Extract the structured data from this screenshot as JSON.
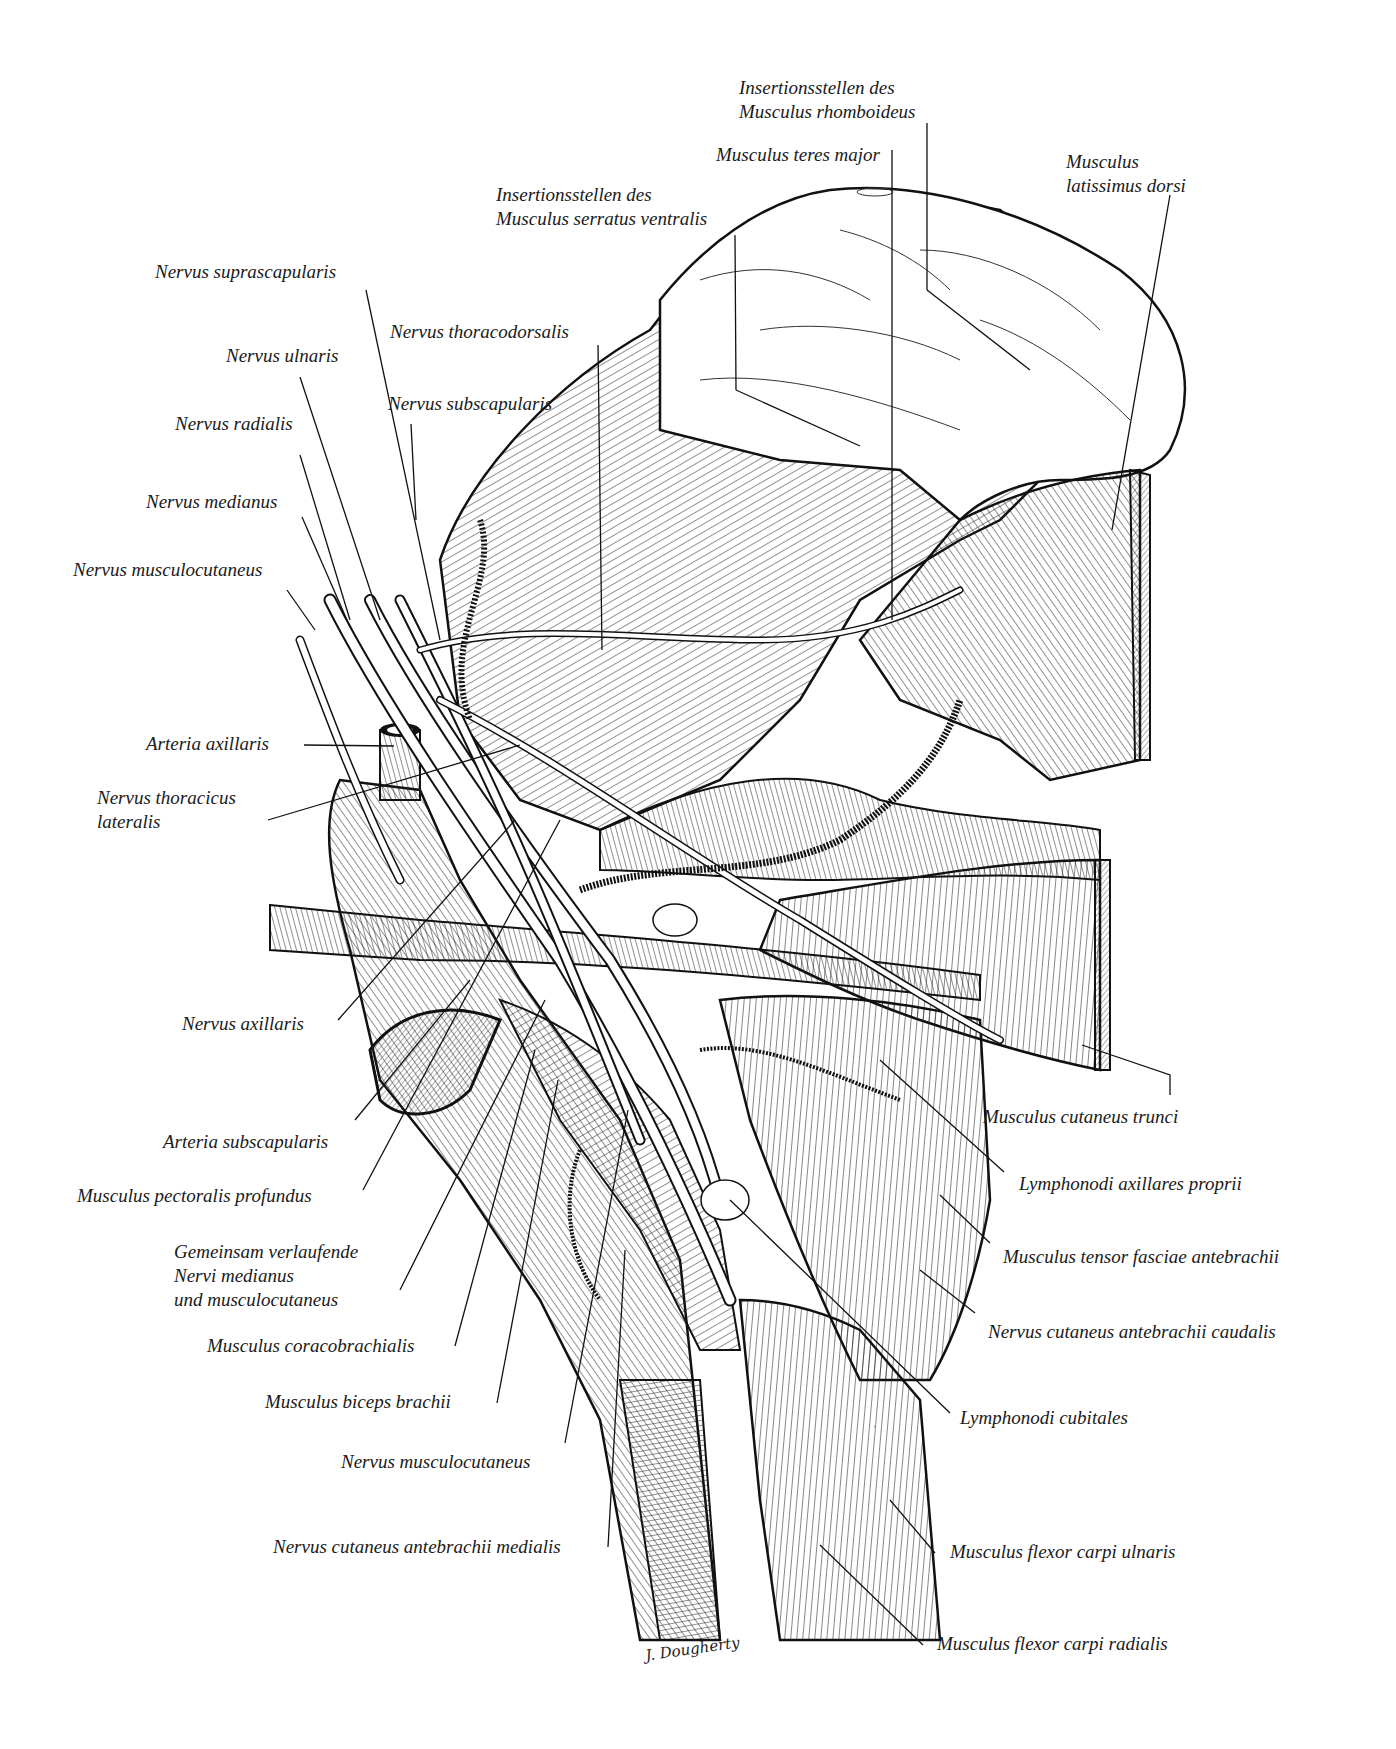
{
  "figure": {
    "signature": "J. Dougherty"
  },
  "labels": {
    "top": {
      "rhomboideus": [
        "Insertionsstellen des",
        "Musculus rhomboideus"
      ],
      "teres_major": "Musculus teres major",
      "latissimus": [
        "Musculus",
        "latissimus dorsi"
      ],
      "serratus": [
        "Insertionsstellen des",
        "Musculus serratus ventralis"
      ]
    },
    "left": {
      "suprascapularis": "Nervus suprascapularis",
      "thoracodorsalis": "Nervus thoracodorsalis",
      "ulnaris": "Nervus ulnaris",
      "subscapularis": "Nervus subscapularis",
      "radialis": "Nervus radialis",
      "medianus": "Nervus medianus",
      "musculocutaneus_top": "Nervus musculocutaneus",
      "arteria_axillaris": "Arteria axillaris",
      "thoracicus_lateralis": [
        "Nervus thoracicus",
        "lateralis"
      ],
      "axillaris": "Nervus axillaris",
      "arteria_subscapularis": "Arteria subscapularis",
      "pectoralis_profundus": "Musculus pectoralis profundus",
      "gemeinsam": [
        "Gemeinsam verlaufende",
        "Nervi medianus",
        "und musculocutaneus"
      ],
      "coracobrachialis": "Musculus coracobrachialis",
      "biceps": "Musculus biceps brachii",
      "musculocutaneus_bottom": "Nervus musculocutaneus",
      "cutaneus_medialis": "Nervus cutaneus antebrachii medialis"
    },
    "right": {
      "cutaneus_trunci": "Musculus cutaneus trunci",
      "lymph_axillares": "Lymphonodi axillares proprii",
      "tensor_fasciae": "Musculus tensor fasciae antebrachii",
      "cutaneus_caudalis": "Nervus cutaneus antebrachii caudalis",
      "lymph_cubitales": "Lymphonodi cubitales",
      "flexor_ulnaris": "Musculus flexor carpi ulnaris",
      "flexor_radialis": "Musculus flexor carpi radialis"
    }
  },
  "colors": {
    "ink": "#1a1a1a",
    "paper": "#ffffff"
  }
}
